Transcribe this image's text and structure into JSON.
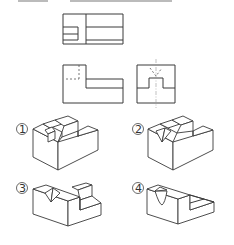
{
  "question": {
    "header_text": "",
    "orthographic_views": {
      "top_view": {
        "label": "top-view"
      },
      "front_view": {
        "label": "front-view"
      },
      "side_view": {
        "label": "right-side-view"
      }
    },
    "options": [
      {
        "marker": "①",
        "label": "option-1"
      },
      {
        "marker": "②",
        "label": "option-2"
      },
      {
        "marker": "③",
        "label": "option-3"
      },
      {
        "marker": "④",
        "label": "option-4"
      }
    ]
  },
  "colors": {
    "line": "#3a3a3a",
    "hidden_line": "#555555",
    "center_line": "#999999",
    "background": "#ffffff"
  }
}
